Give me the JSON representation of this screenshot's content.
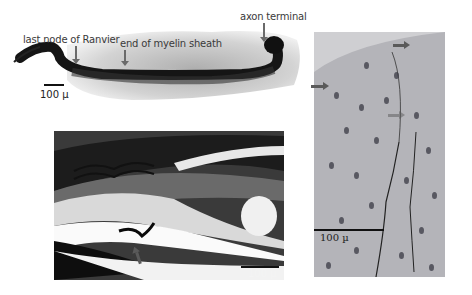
{
  "figure": {
    "panel_top": {
      "labels": {
        "node": "last node of Ranvier",
        "myelin": "end of myelin sheath",
        "terminal": "axon terminal"
      },
      "scale": "100 µ"
    },
    "panel_bottom_left": {
      "scale": "100 µ"
    },
    "panel_right": {
      "scale": "100 µ"
    },
    "colors": {
      "background": "#ffffff",
      "stain_dark": "#1a1a1a",
      "tissue_gray": "#b9b9bd",
      "arrow": "#5a5a5a"
    }
  }
}
